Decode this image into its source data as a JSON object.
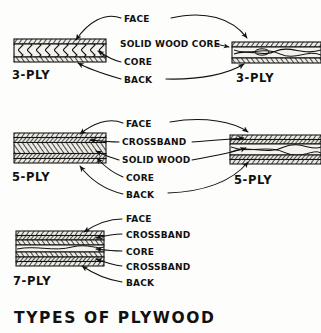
{
  "title": "TYPES OF PLYWOOD",
  "colors": {
    "ink": "#111111",
    "paper": "#fdfdfb",
    "veneer_fill": "#e8e6e0",
    "core_fill": "#f2f0ea"
  },
  "groups": [
    {
      "id": "three-ply",
      "left_caption": "3-PLY",
      "right_caption": "3-PLY",
      "labels": [
        "FACE",
        "SOLID WOOD CORE",
        "CORE",
        "BACK"
      ],
      "left_panel": {
        "caption": "3-PLY",
        "construction": "veneer-core",
        "layers": [
          "face",
          "core",
          "back"
        ]
      },
      "right_panel": {
        "caption": "3-PLY",
        "construction": "solid-wood-core",
        "layers": [
          "face",
          "solid wood core",
          "back"
        ]
      }
    },
    {
      "id": "five-ply",
      "left_caption": "5-PLY",
      "right_caption": "5-PLY",
      "labels": [
        "FACE",
        "CROSSBAND",
        "SOLID WOOD",
        "CORE",
        "BACK"
      ],
      "left_panel": {
        "caption": "5-PLY",
        "construction": "veneer-core",
        "layers": [
          "face",
          "crossband",
          "core",
          "crossband",
          "back"
        ]
      },
      "right_panel": {
        "caption": "5-PLY",
        "construction": "solid-wood-core",
        "layers": [
          "face",
          "crossband",
          "solid wood",
          "crossband",
          "back"
        ]
      }
    },
    {
      "id": "seven-ply",
      "left_caption": "7-PLY",
      "labels": [
        "FACE",
        "CROSSBAND",
        "CORE",
        "CROSSBAND",
        "BACK"
      ],
      "left_panel": {
        "caption": "7-PLY",
        "construction": "veneer-core",
        "layers": [
          "face",
          "crossband",
          "core",
          "core",
          "core",
          "crossband",
          "back"
        ]
      }
    }
  ]
}
